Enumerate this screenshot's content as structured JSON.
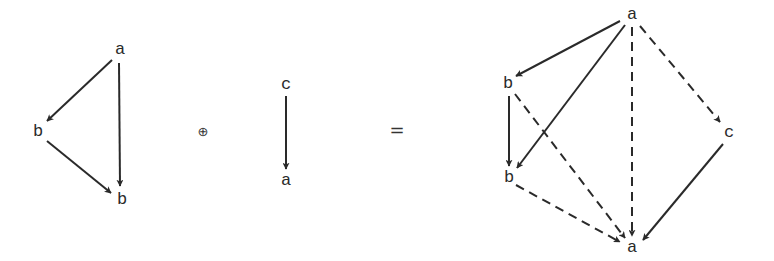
{
  "colors": {
    "stroke": "#2a2a2a",
    "background": "#ffffff"
  },
  "operators": {
    "plus": "⊕",
    "equals": "="
  },
  "graphs": [
    {
      "name": "left-graph",
      "nodes": [
        {
          "id": "L_a",
          "label": "a",
          "x": 120,
          "y": 49
        },
        {
          "id": "L_b1",
          "label": "b",
          "x": 38,
          "y": 131
        },
        {
          "id": "L_b2",
          "label": "b",
          "x": 122,
          "y": 199
        }
      ],
      "edges": [
        {
          "from": "L_a",
          "to": "L_b1",
          "style": "solid",
          "x1": 112,
          "y1": 60,
          "x2": 47,
          "y2": 121
        },
        {
          "from": "L_a",
          "to": "L_b2",
          "style": "solid",
          "x1": 119,
          "y1": 63,
          "x2": 120,
          "y2": 186
        },
        {
          "from": "L_b1",
          "to": "L_b2",
          "style": "solid",
          "x1": 47,
          "y1": 141,
          "x2": 111,
          "y2": 193
        }
      ]
    },
    {
      "name": "middle-graph",
      "nodes": [
        {
          "id": "M_c",
          "label": "c",
          "x": 286,
          "y": 84
        },
        {
          "id": "M_a",
          "label": "a",
          "x": 286,
          "y": 180
        }
      ],
      "edges": [
        {
          "from": "M_c",
          "to": "M_a",
          "style": "solid",
          "x1": 286,
          "y1": 96,
          "x2": 286,
          "y2": 169
        }
      ]
    },
    {
      "name": "right-graph",
      "nodes": [
        {
          "id": "R_a_top",
          "label": "a",
          "x": 632,
          "y": 14
        },
        {
          "id": "R_b_top",
          "label": "b",
          "x": 508,
          "y": 83
        },
        {
          "id": "R_b_bot",
          "label": "b",
          "x": 509,
          "y": 177
        },
        {
          "id": "R_c",
          "label": "c",
          "x": 729,
          "y": 132
        },
        {
          "id": "R_a_bot",
          "label": "a",
          "x": 632,
          "y": 247
        }
      ],
      "edges": [
        {
          "from": "R_a_top",
          "to": "R_b_top",
          "style": "solid",
          "x1": 620,
          "y1": 21,
          "x2": 516,
          "y2": 76
        },
        {
          "from": "R_a_top",
          "to": "R_b_bot",
          "style": "solid",
          "x1": 625,
          "y1": 25,
          "x2": 517,
          "y2": 168
        },
        {
          "from": "R_b_top",
          "to": "R_b_bot",
          "style": "solid",
          "x1": 509,
          "y1": 96,
          "x2": 509,
          "y2": 166
        },
        {
          "from": "R_c",
          "to": "R_a_bot",
          "style": "solid",
          "x1": 723,
          "y1": 144,
          "x2": 643,
          "y2": 240
        },
        {
          "from": "R_a_top",
          "to": "R_a_bot",
          "style": "dashed",
          "x1": 632,
          "y1": 27,
          "x2": 632,
          "y2": 236
        },
        {
          "from": "R_a_top",
          "to": "R_c",
          "style": "dashed",
          "x1": 640,
          "y1": 26,
          "x2": 720,
          "y2": 122
        },
        {
          "from": "R_b_top",
          "to": "R_a_bot",
          "style": "dashed",
          "x1": 515,
          "y1": 94,
          "x2": 625,
          "y2": 238
        },
        {
          "from": "R_b_bot",
          "to": "R_a_bot",
          "style": "dashed",
          "x1": 516,
          "y1": 185,
          "x2": 620,
          "y2": 242
        }
      ]
    }
  ],
  "operator_positions": {
    "plus": {
      "x": 203,
      "y": 131
    },
    "equals": {
      "x": 397,
      "y": 130
    }
  }
}
